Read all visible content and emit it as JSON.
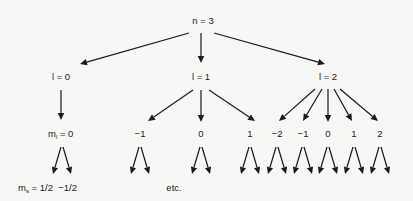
{
  "diagram": {
    "root": {
      "id": "n",
      "label": "n = 3"
    },
    "l_nodes": [
      {
        "id": "l0",
        "label": "l = 0"
      },
      {
        "id": "l1",
        "label": "l = 1"
      },
      {
        "id": "l2",
        "label": "l = 2"
      }
    ],
    "ml_nodes": [
      {
        "id": "ml0_0",
        "parent": "l0",
        "prefix": "m",
        "sub": "l",
        "label": " = 0"
      },
      {
        "id": "ml1_m1",
        "parent": "l1",
        "label": "−1"
      },
      {
        "id": "ml1_0",
        "parent": "l1",
        "label": "0"
      },
      {
        "id": "ml1_1",
        "parent": "l1",
        "label": "1"
      },
      {
        "id": "ml2_m2",
        "parent": "l2",
        "label": "−2"
      },
      {
        "id": "ml2_m1",
        "parent": "l2",
        "label": "−1"
      },
      {
        "id": "ml2_0",
        "parent": "l2",
        "label": "0"
      },
      {
        "id": "ml2_1",
        "parent": "l2",
        "label": "1"
      },
      {
        "id": "ml2_2",
        "parent": "l2",
        "label": "2"
      }
    ],
    "ms_label": {
      "prefix": "m",
      "sub": "s",
      "label": " = 1/2  −1/2"
    },
    "etc_label": "etc.",
    "colors": {
      "ink": "#1a1a1a",
      "background": "#f7f7f5"
    }
  }
}
